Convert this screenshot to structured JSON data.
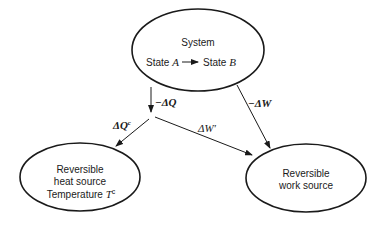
{
  "nodes": {
    "system": {
      "title": "System",
      "state_from_prefix": "State",
      "state_from_var": "A",
      "state_to_prefix": "State",
      "state_to_var": "B"
    },
    "heat_source": {
      "line1": "Reversible",
      "line2": "heat source",
      "line3_prefix": "Temperature",
      "temp_var": "T",
      "temp_sup": "c"
    },
    "work_source": {
      "line1": "Reversible",
      "line2": "work source"
    }
  },
  "edges": {
    "minus_dQ": "−ΔQ",
    "minus_dW": "−ΔW",
    "dQc_base": "ΔQ",
    "dQc_sup": "c",
    "dWprime": "ΔW′"
  },
  "colors": {
    "stroke": "#1a1a1a",
    "background": "#ffffff"
  }
}
